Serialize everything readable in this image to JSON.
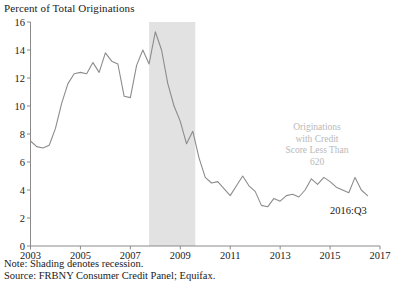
{
  "chart_data": {
    "type": "line",
    "title": "Percent of Total Originations",
    "xlabel": "",
    "ylabel": "Percent of Total Originations",
    "xlim": [
      2003,
      2017
    ],
    "ylim": [
      0,
      16
    ],
    "ytick_step": 2,
    "xtick_step": 2,
    "yticks": [
      "0",
      "2",
      "4",
      "6",
      "8",
      "10",
      "12",
      "14",
      "16"
    ],
    "ytick_values": [
      0,
      2,
      4,
      6,
      8,
      10,
      12,
      14,
      16
    ],
    "xticks": [
      "2003",
      "2005",
      "2007",
      "2009",
      "2011",
      "2013",
      "2015",
      "2017"
    ],
    "xtick_values": [
      2003,
      2005,
      2007,
      2009,
      2011,
      2013,
      2015,
      2017
    ],
    "grid": false,
    "legend": null,
    "line_color": "#8c8c8c",
    "shading_color": "#e2e2e2",
    "shaded_region": {
      "label": "recession",
      "x0": 2007.75,
      "x1": 2009.6
    },
    "series": [
      {
        "name": "Originations with Credit Score Less Than 620",
        "x": [
          2003.0,
          2003.25,
          2003.5,
          2003.75,
          2004.0,
          2004.25,
          2004.5,
          2004.75,
          2005.0,
          2005.25,
          2005.5,
          2005.75,
          2006.0,
          2006.25,
          2006.5,
          2006.75,
          2007.0,
          2007.25,
          2007.5,
          2007.75,
          2008.0,
          2008.25,
          2008.5,
          2008.75,
          2009.0,
          2009.25,
          2009.5,
          2009.75,
          2010.0,
          2010.25,
          2010.5,
          2010.75,
          2011.0,
          2011.25,
          2011.5,
          2011.75,
          2012.0,
          2012.25,
          2012.5,
          2012.75,
          2013.0,
          2013.25,
          2013.5,
          2013.75,
          2014.0,
          2014.25,
          2014.5,
          2014.75,
          2015.0,
          2015.25,
          2015.5,
          2015.75,
          2016.0,
          2016.25,
          2016.5
        ],
        "values": [
          7.5,
          7.1,
          7.0,
          7.2,
          8.4,
          10.2,
          11.6,
          12.3,
          12.4,
          12.3,
          13.1,
          12.4,
          13.8,
          13.2,
          13.0,
          10.7,
          10.6,
          12.9,
          14.0,
          13.0,
          15.3,
          14.0,
          11.6,
          10.0,
          8.9,
          7.3,
          8.2,
          6.3,
          4.9,
          4.5,
          4.6,
          4.1,
          3.6,
          4.3,
          5.0,
          4.3,
          3.9,
          2.9,
          2.8,
          3.4,
          3.2,
          3.6,
          3.7,
          3.5,
          4.0,
          4.8,
          4.4,
          4.9,
          4.6,
          4.2,
          4.0,
          3.8,
          4.9,
          4.0,
          3.6
        ]
      }
    ],
    "annotations": [
      {
        "name": "series-annotation",
        "lines": [
          "Originations",
          "with Credit",
          "Score Less Than",
          "620"
        ],
        "color": "#b9b9b9"
      },
      {
        "name": "end-value-label",
        "text": "2016:Q3",
        "color": "#171717"
      }
    ]
  },
  "footnotes": {
    "note": "Note: Shading denotes recession.",
    "source": "Source: FRBNY Consumer Credit Panel; Equifax."
  }
}
